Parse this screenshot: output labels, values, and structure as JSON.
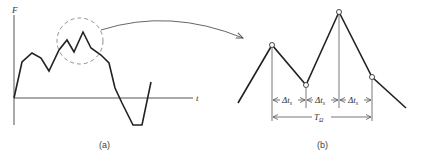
{
  "panel_a": {
    "caption": "(a)",
    "y_axis_label": "F",
    "x_axis_label": "t",
    "curve_points": [
      [
        14,
        98
      ],
      [
        22,
        62
      ],
      [
        32,
        53
      ],
      [
        41,
        58
      ],
      [
        49,
        71
      ],
      [
        59,
        50
      ],
      [
        67,
        40
      ],
      [
        74,
        52
      ],
      [
        83,
        32
      ],
      [
        91,
        48
      ],
      [
        101,
        55
      ],
      [
        109,
        63
      ],
      [
        115,
        88
      ],
      [
        122,
        103
      ],
      [
        133,
        125
      ],
      [
        142,
        125
      ],
      [
        151,
        82
      ]
    ],
    "highlight_circle": {
      "cx": 80,
      "cy": 41,
      "r": 23,
      "style": "dashed"
    }
  },
  "connector_arrow": {
    "from": [
      101,
      30
    ],
    "to": [
      243,
      38
    ]
  },
  "panel_b": {
    "caption": "(b)",
    "curve_points": [
      [
        238,
        103
      ],
      [
        272,
        45
      ],
      [
        306,
        85
      ],
      [
        339,
        12
      ],
      [
        372,
        77
      ],
      [
        406,
        108
      ]
    ],
    "sample_points": [
      [
        272,
        45
      ],
      [
        306,
        85
      ],
      [
        339,
        12
      ],
      [
        372,
        77
      ]
    ],
    "interval_label_main": "Δt",
    "interval_label_sub": "s",
    "intervals": [
      "Δt_s",
      "Δt_s",
      "Δt_s"
    ],
    "period_label_main": "T",
    "period_label_sub": "Ω"
  },
  "colors": {
    "line": "#222222",
    "guide": "#555555",
    "dashed": "#777777"
  }
}
